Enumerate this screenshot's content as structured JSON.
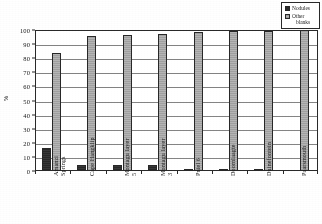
{
  "chart_data": {
    "type": "bar",
    "title": "",
    "xlabel": "",
    "ylabel": "%",
    "ylim": [
      0,
      100
    ],
    "ytick_step": 10,
    "yticks": [
      "100",
      "90",
      "80",
      "70",
      "60",
      "50",
      "40",
      "30",
      "20",
      "10",
      "0"
    ],
    "grid": true,
    "legend_position": "top-right",
    "categories": [
      "Amanzi Springs",
      "Cape Hangklip",
      "Montagu layer 5",
      "Montagu layer 3",
      "Pniel 6",
      "Doornlaagte",
      "Duinefontein",
      "Paarsmouth"
    ],
    "category_lines": [
      [
        "Amanzi",
        "Springs"
      ],
      [
        "Cape Hangklip",
        ""
      ],
      [
        "Montagu layer",
        "5"
      ],
      [
        "Montagu layer",
        "3"
      ],
      [
        "Pniel 6",
        ""
      ],
      [
        "Doornlaagte",
        ""
      ],
      [
        "Duinefontein",
        ""
      ],
      [
        "Paarsmouth",
        ""
      ]
    ],
    "series": [
      {
        "name": "Nodules",
        "color": "#2e2e2e",
        "values": [
          16,
          4.5,
          4.5,
          4,
          1.5,
          1,
          1,
          0
        ]
      },
      {
        "name": "Other blanks",
        "color": "#a6a6a6",
        "values": [
          84,
          96,
          96.5,
          97,
          98.5,
          99,
          99,
          100
        ]
      }
    ]
  },
  "legend": {
    "items": [
      {
        "label": "Nodules",
        "label_line1": "Nodules",
        "label_line2": ""
      },
      {
        "label": "Other blanks",
        "label_line1": "Other",
        "label_line2": "blanks"
      }
    ]
  },
  "axes": {
    "y_axis_title": "%"
  }
}
